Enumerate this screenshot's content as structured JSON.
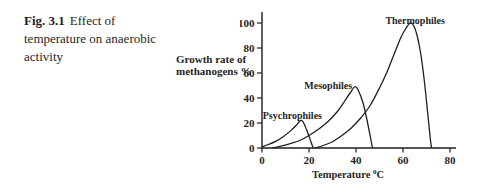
{
  "figure": {
    "caption_label": "Fig. 3.1",
    "caption_text": "Effect of temperature on anaerobic activity"
  },
  "axes": {
    "ylabel_lines": [
      "Growth rate of",
      "methanogens %"
    ],
    "xlabel_text": "Temperature ",
    "xlabel_superscript": "0",
    "xlabel_unit": "C"
  },
  "chart_data": {
    "type": "line",
    "title": "Effect of temperature on anaerobic activity",
    "xlabel": "Temperature ⁰C",
    "ylabel": "Growth rate of methanogens %",
    "xlim": [
      0,
      80
    ],
    "ylim": [
      0,
      100
    ],
    "xticks": [
      0,
      20,
      40,
      60,
      80
    ],
    "yticks": [
      0,
      20,
      40,
      60,
      80,
      100
    ],
    "grid": false,
    "legend": "inline-annotations",
    "series": [
      {
        "name": "Psychrophiles",
        "peak": {
          "x": 17,
          "y": 22
        },
        "range": [
          0,
          21.8
        ],
        "label_pos": [
          0.3,
          23.5
        ],
        "points": [
          [
            0,
            1
          ],
          [
            3,
            3
          ],
          [
            6,
            5.5
          ],
          [
            9,
            9
          ],
          [
            12,
            13.5
          ],
          [
            14.5,
            18
          ],
          [
            16,
            21.5
          ],
          [
            17,
            22
          ],
          [
            18,
            19
          ],
          [
            19.5,
            12
          ],
          [
            21,
            4
          ],
          [
            21.8,
            0
          ]
        ]
      },
      {
        "name": "Mesophiles",
        "peak": {
          "x": 39.5,
          "y": 49
        },
        "range": [
          4.5,
          47
        ],
        "label_pos": [
          18,
          47.5
        ],
        "points": [
          [
            4.5,
            0
          ],
          [
            8,
            1.5
          ],
          [
            12,
            3.5
          ],
          [
            16,
            6
          ],
          [
            20,
            10
          ],
          [
            24,
            15
          ],
          [
            28,
            21
          ],
          [
            32,
            29
          ],
          [
            35,
            37
          ],
          [
            37.5,
            44
          ],
          [
            39.5,
            49
          ],
          [
            41,
            46
          ],
          [
            43,
            36
          ],
          [
            44.5,
            24
          ],
          [
            46,
            10
          ],
          [
            47,
            0
          ]
        ]
      },
      {
        "name": "Thermophiles",
        "peak": {
          "x": 63,
          "y": 100
        },
        "range": [
          22.5,
          72.2
        ],
        "label_pos": [
          52.5,
          99.5
        ],
        "points": [
          [
            22.5,
            0
          ],
          [
            26,
            2
          ],
          [
            30,
            5
          ],
          [
            34,
            10
          ],
          [
            38,
            16
          ],
          [
            42,
            24
          ],
          [
            46,
            34
          ],
          [
            50,
            48
          ],
          [
            53,
            60
          ],
          [
            56,
            74
          ],
          [
            59,
            88
          ],
          [
            61,
            95
          ],
          [
            63,
            100
          ],
          [
            64.5,
            98
          ],
          [
            66,
            90
          ],
          [
            67.5,
            76
          ],
          [
            69,
            55
          ],
          [
            70.5,
            28
          ],
          [
            71.7,
            6
          ],
          [
            72.2,
            0
          ]
        ]
      }
    ]
  },
  "colors": {
    "ink": "#1f1f1f",
    "background": "#ffffff"
  }
}
